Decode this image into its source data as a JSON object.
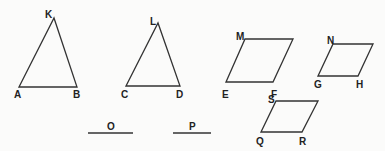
{
  "diagram": {
    "background": "#fbfbfa",
    "stroke_color": "#333333",
    "shapes": [
      {
        "id": "triangle-akb",
        "type": "triangle",
        "points": [
          [
            19,
            87
          ],
          [
            54,
            18
          ],
          [
            77,
            87
          ]
        ],
        "labels": [
          {
            "text": "K",
            "x": 45,
            "y": 18
          },
          {
            "text": "A",
            "x": 14,
            "y": 98
          },
          {
            "text": "B",
            "x": 73,
            "y": 98
          }
        ]
      },
      {
        "id": "triangle-cld",
        "type": "triangle",
        "points": [
          [
            126,
            86
          ],
          [
            158,
            23
          ],
          [
            180,
            86
          ]
        ],
        "labels": [
          {
            "text": "L",
            "x": 150,
            "y": 25
          },
          {
            "text": "C",
            "x": 121,
            "y": 98
          },
          {
            "text": "D",
            "x": 176,
            "y": 98
          }
        ]
      },
      {
        "id": "parallelogram-mef",
        "type": "parallelogram",
        "points": [
          [
            226,
            82
          ],
          [
            245,
            39
          ],
          [
            293,
            39
          ],
          [
            273,
            82
          ]
        ],
        "labels": [
          {
            "text": "M",
            "x": 236,
            "y": 40
          },
          {
            "text": "E",
            "x": 222,
            "y": 98
          },
          {
            "text": "F",
            "x": 271,
            "y": 98
          }
        ]
      },
      {
        "id": "parallelogram-ngh",
        "type": "parallelogram",
        "points": [
          [
            318,
            76
          ],
          [
            333,
            44
          ],
          [
            373,
            44
          ],
          [
            358,
            76
          ]
        ],
        "labels": [
          {
            "text": "N",
            "x": 327,
            "y": 44
          },
          {
            "text": "G",
            "x": 314,
            "y": 88
          },
          {
            "text": "H",
            "x": 356,
            "y": 88
          }
        ]
      },
      {
        "id": "parallelogram-sqr",
        "type": "parallelogram",
        "points": [
          [
            261,
            132
          ],
          [
            276,
            101
          ],
          [
            318,
            101
          ],
          [
            302,
            132
          ]
        ],
        "labels": [
          {
            "text": "S",
            "x": 268,
            "y": 103
          },
          {
            "text": "Q",
            "x": 256,
            "y": 145
          },
          {
            "text": "R",
            "x": 299,
            "y": 145
          }
        ]
      }
    ],
    "segments": [
      {
        "id": "segment-o",
        "x1": 88,
        "y1": 133,
        "x2": 133,
        "y2": 133,
        "label": {
          "text": "O",
          "x": 107,
          "y": 130
        }
      },
      {
        "id": "segment-p",
        "x1": 173,
        "y1": 133,
        "x2": 211,
        "y2": 133,
        "label": {
          "text": "P",
          "x": 189,
          "y": 130
        }
      }
    ]
  }
}
